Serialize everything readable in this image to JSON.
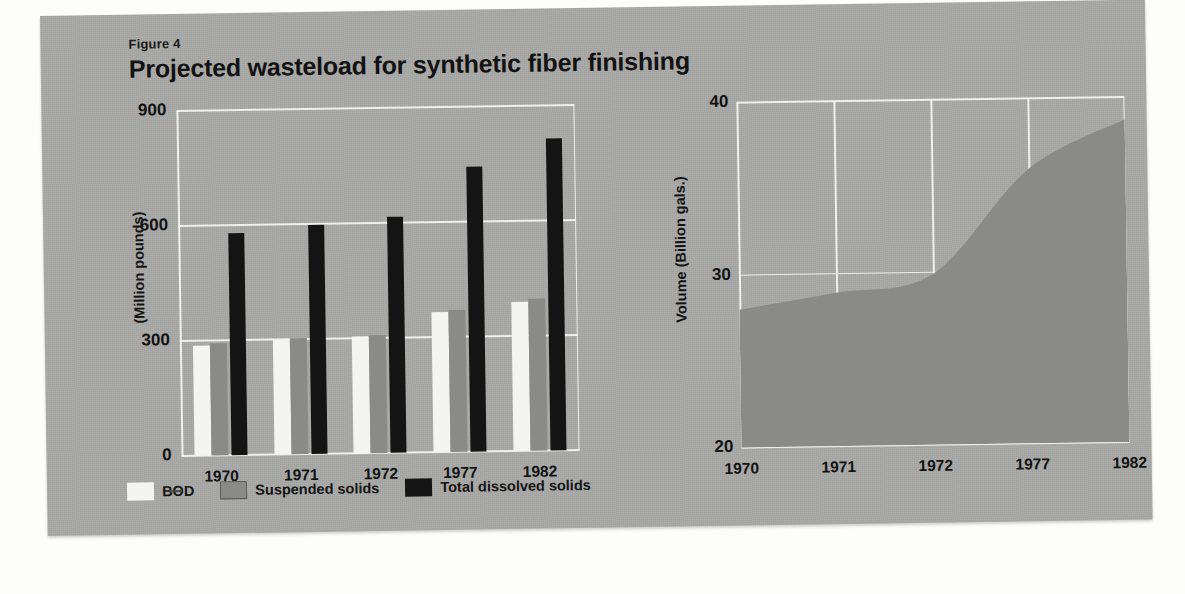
{
  "figure": {
    "label": "Figure 4",
    "title": "Projected wasteload for synthetic fiber finishing"
  },
  "colors": {
    "panel_background": "#a9a9a7",
    "page_background": "#fdfdfc",
    "gridline": "#f2f2ef",
    "bod": "#f4f4f1",
    "suspended_solids": "#8a8a88",
    "total_dissolved_solids": "#141414",
    "area_fill": "#8a8a88",
    "text": "#121212"
  },
  "legend": {
    "items": [
      {
        "label": "BOD",
        "color": "#f4f4f1"
      },
      {
        "label": "Suspended solids",
        "color": "#8a8a88"
      },
      {
        "label": "Total dissolved solids",
        "color": "#141414"
      }
    ]
  },
  "chart_data": [
    {
      "type": "bar",
      "id": "wasteload-bar-chart",
      "title": "Projected wasteload for synthetic fiber finishing",
      "xlabel": "",
      "ylabel": "(Million pounds)",
      "categories": [
        "1970",
        "1971",
        "1972",
        "1977",
        "1982"
      ],
      "yticks": [
        "0",
        "300",
        "600",
        "900"
      ],
      "ytick_values": [
        0,
        300,
        600,
        900
      ],
      "ylim": [
        0,
        900
      ],
      "grid": true,
      "legend_position": "bottom",
      "series": [
        {
          "name": "BOD",
          "color": "#f4f4f1",
          "values": [
            288,
            300,
            304,
            365,
            390
          ]
        },
        {
          "name": "Suspended solids",
          "color": "#8a8a88",
          "values": [
            292,
            303,
            307,
            370,
            396
          ]
        },
        {
          "name": "Total dissolved solids",
          "color": "#141414",
          "values": [
            580,
            598,
            615,
            743,
            813
          ]
        }
      ]
    },
    {
      "type": "area",
      "id": "volume-area-chart",
      "title": "",
      "xlabel": "",
      "ylabel": "Volume (Billion gals.)",
      "categories": [
        "1970",
        "1971",
        "1972",
        "1977",
        "1982"
      ],
      "x": [
        1970,
        1971,
        1972,
        1977,
        1982
      ],
      "values": [
        28.0,
        28.9,
        29.9,
        35.9,
        38.7
      ],
      "yticks": [
        "20",
        "30",
        "40"
      ],
      "ytick_values": [
        20,
        30,
        40
      ],
      "ylim": [
        20,
        40
      ],
      "grid": true,
      "legend_position": "none",
      "fill_color": "#8a8a88"
    }
  ]
}
